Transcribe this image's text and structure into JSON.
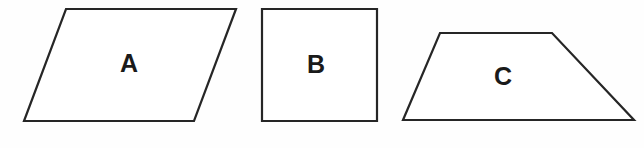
{
  "figure": {
    "background_color": "#fefefe",
    "stroke_color": "#262626",
    "fill_color": "#ffffff",
    "label_color": "#1a1a1a",
    "stroke_width": 2.2,
    "width": 644,
    "height": 148
  },
  "shapes": [
    {
      "id": "shape-a",
      "label": "A",
      "kind": "parallelogram",
      "points": "66,9 236,9 194,121 24,121",
      "label_x": 129,
      "label_y": 63
    },
    {
      "id": "shape-b",
      "label": "B",
      "kind": "square",
      "points": "262,9 377,9 377,121 262,121",
      "label_x": 316,
      "label_y": 64
    },
    {
      "id": "shape-c",
      "label": "C",
      "kind": "trapezoid",
      "points": "440,33 552,33 634,120 403,120",
      "label_x": 503,
      "label_y": 76
    }
  ]
}
